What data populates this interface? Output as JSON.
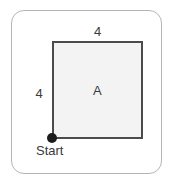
{
  "figure": {
    "type": "geometry-diagram",
    "frame": {
      "border_color": "#b5b5b5",
      "background_color": "#ffffff"
    },
    "shape": {
      "name": "square",
      "interior_label": "A",
      "fill_color": "#f3f3f3",
      "stroke_color": "#4b4b4b"
    },
    "dimensions": {
      "top_side_label": "4",
      "left_side_label": "4"
    },
    "marker": {
      "label": "Start",
      "dot_color": "#1c1c1c",
      "position": "bottom-left-corner"
    },
    "text_color": "#3a3a3a"
  }
}
